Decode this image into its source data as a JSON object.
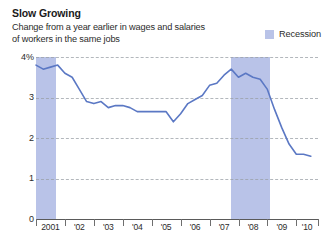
{
  "header": {
    "title": "Slow Growing",
    "subtitle_line1": "Change from a year earlier in wages and salaries",
    "subtitle_line2": "of workers in the same jobs"
  },
  "legend": {
    "items": [
      {
        "label": "Recession",
        "color": "#b9c3e8",
        "icon": "square-swatch-icon"
      }
    ]
  },
  "colors": {
    "line": "#5b78c4",
    "recession_band": "#b9c3e8",
    "gridline": "#9aa0a6",
    "axis": "#5a5a5a",
    "text": "#2b2b2b"
  },
  "chart_data": {
    "type": "line",
    "title": "Slow Growing",
    "subtitle": "Change from a year earlier in wages and salaries of workers in the same jobs",
    "xlabel": "",
    "ylabel": "",
    "ylim": [
      0,
      4
    ],
    "yticks": [
      0,
      1,
      2,
      3,
      4
    ],
    "ytick_labels": [
      "0",
      "1",
      "2",
      "3",
      "4%"
    ],
    "xlim": [
      2001,
      2010.75
    ],
    "xticks": [
      2001,
      2002,
      2003,
      2004,
      2005,
      2006,
      2007,
      2008,
      2009,
      2010
    ],
    "xtick_labels": [
      "2001",
      "'02",
      "'03",
      "'04",
      "'05",
      "'06",
      "'07",
      "'08",
      "'09",
      "'10"
    ],
    "grid": "horizontal-dashed",
    "legend_position": "top-right",
    "series": [
      {
        "name": "Change in wages and salaries",
        "color": "#5b78c4",
        "unit": "percent",
        "x": [
          2001.0,
          2001.25,
          2001.5,
          2001.75,
          2002.0,
          2002.25,
          2002.5,
          2002.75,
          2003.0,
          2003.25,
          2003.5,
          2003.75,
          2004.0,
          2004.25,
          2004.5,
          2004.75,
          2005.0,
          2005.25,
          2005.5,
          2005.75,
          2006.0,
          2006.25,
          2006.5,
          2006.75,
          2007.0,
          2007.25,
          2007.5,
          2007.75,
          2008.0,
          2008.25,
          2008.5,
          2008.75,
          2009.0,
          2009.25,
          2009.5,
          2009.75,
          2010.0,
          2010.25,
          2010.5
        ],
        "values": [
          3.8,
          3.7,
          3.75,
          3.8,
          3.6,
          3.5,
          3.2,
          2.9,
          2.85,
          2.9,
          2.75,
          2.8,
          2.8,
          2.75,
          2.65,
          2.65,
          2.65,
          2.65,
          2.65,
          2.4,
          2.6,
          2.85,
          2.95,
          3.05,
          3.3,
          3.35,
          3.55,
          3.7,
          3.5,
          3.6,
          3.5,
          3.45,
          3.2,
          2.7,
          2.25,
          1.85,
          1.6,
          1.6,
          1.55
        ]
      }
    ],
    "annotations": [
      {
        "type": "span",
        "name": "recession-band-2001",
        "x_start": 2001.0,
        "x_end": 2001.7,
        "label": "Recession"
      },
      {
        "type": "span",
        "name": "recession-band-2008",
        "x_start": 2007.75,
        "x_end": 2009.1,
        "label": "Recession"
      }
    ]
  }
}
